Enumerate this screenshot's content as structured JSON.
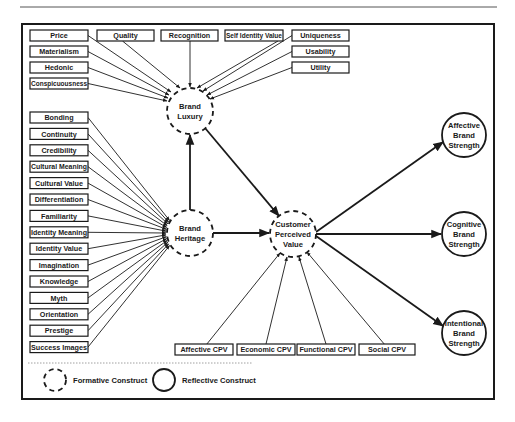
{
  "diagram": {
    "colors": {
      "stroke": "#1a1a1a",
      "background": "#ffffff",
      "rule": "#555555"
    },
    "constructs": [
      {
        "id": "brand_luxury",
        "lines": [
          "Brand",
          "Luxury"
        ],
        "type": "formative",
        "cx": 190,
        "cy": 111,
        "r": 23
      },
      {
        "id": "brand_heritage",
        "lines": [
          "Brand",
          "Heritage"
        ],
        "type": "formative",
        "cx": 190,
        "cy": 233,
        "r": 23
      },
      {
        "id": "customer_perceived_value",
        "lines": [
          "Customer",
          "Perceived",
          "Value"
        ],
        "type": "formative",
        "cx": 293,
        "cy": 234,
        "r": 23
      },
      {
        "id": "affective_brand_strength",
        "lines": [
          "Affective",
          "Brand",
          "Strength"
        ],
        "type": "reflective",
        "cx": 464,
        "cy": 135,
        "r": 22
      },
      {
        "id": "cognitive_brand_strength",
        "lines": [
          "Cognitive",
          "Brand",
          "Strength"
        ],
        "type": "reflective",
        "cx": 464,
        "cy": 234,
        "r": 22
      },
      {
        "id": "intentional_brand_strength",
        "lines": [
          "Intentional",
          "Brand",
          "Strength"
        ],
        "type": "reflective",
        "cx": 464,
        "cy": 333,
        "r": 22
      }
    ],
    "luxury_indicators": [
      {
        "label": "Price",
        "x": 30,
        "y": 30,
        "w": 58,
        "h": 11,
        "tx": 171,
        "ty": 92
      },
      {
        "label": "Materialism",
        "x": 30,
        "y": 46,
        "w": 58,
        "h": 11,
        "tx": 169,
        "ty": 95
      },
      {
        "label": "Hedonic",
        "x": 30,
        "y": 62,
        "w": 58,
        "h": 11,
        "tx": 168,
        "ty": 98
      },
      {
        "label": "Conspicuousness",
        "x": 30,
        "y": 78,
        "w": 58,
        "h": 11,
        "tx": 167,
        "ty": 101
      },
      {
        "label": "Quality",
        "x": 97,
        "y": 30,
        "w": 57,
        "h": 11,
        "tx": 180,
        "ty": 88
      },
      {
        "label": "Recognition",
        "x": 161,
        "y": 30,
        "w": 57,
        "h": 11,
        "tx": 190,
        "ty": 87
      },
      {
        "label": "Self Identity Value",
        "x": 225,
        "y": 30,
        "w": 58,
        "h": 11,
        "tx": 197,
        "ty": 88
      },
      {
        "label": "Uniqueness",
        "x": 292,
        "y": 30,
        "w": 57,
        "h": 11,
        "tx": 203,
        "ty": 91
      },
      {
        "label": "Usability",
        "x": 292,
        "y": 46,
        "w": 57,
        "h": 11,
        "tx": 207,
        "ty": 95
      },
      {
        "label": "Utility",
        "x": 292,
        "y": 62,
        "w": 57,
        "h": 11,
        "tx": 210,
        "ty": 99
      }
    ],
    "heritage_indicators": [
      {
        "label": "Bonding",
        "y": 112
      },
      {
        "label": "Continuity",
        "y": 128.4
      },
      {
        "label": "Credibility",
        "y": 144.8
      },
      {
        "label": "Cultural Meaning",
        "y": 161.2
      },
      {
        "label": "Cultural Value",
        "y": 177.6
      },
      {
        "label": "Differentiation",
        "y": 194
      },
      {
        "label": "Familiarity",
        "y": 210.4
      },
      {
        "label": "Identity Meaning",
        "y": 226.8
      },
      {
        "label": "Identity Value",
        "y": 243.2
      },
      {
        "label": "Imagination",
        "y": 259.6
      },
      {
        "label": "Knowledge",
        "y": 276
      },
      {
        "label": "Myth",
        "y": 292.4
      },
      {
        "label": "Orientation",
        "y": 308.8
      },
      {
        "label": "Prestige",
        "y": 325.2
      },
      {
        "label": "Success Images",
        "y": 341.6
      }
    ],
    "heritage_box": {
      "x": 30,
      "w": 58,
      "h": 11
    },
    "cpv_indicators": [
      {
        "label": "Affective CPV",
        "x": 175,
        "y": 344,
        "w": 58,
        "h": 11,
        "tx": 280,
        "ty": 253
      },
      {
        "label": "Economic CPV",
        "x": 237,
        "y": 344,
        "w": 58,
        "h": 11,
        "tx": 287,
        "ty": 257
      },
      {
        "label": "Functional CPV",
        "x": 297,
        "y": 344,
        "w": 58,
        "h": 11,
        "tx": 299,
        "ty": 257
      },
      {
        "label": "Social CPV",
        "x": 359,
        "y": 344,
        "w": 56,
        "h": 11,
        "tx": 307,
        "ty": 252
      }
    ],
    "structural_paths": [
      {
        "from": "brand_heritage",
        "x1": 190,
        "y1": 210,
        "x2": 190,
        "y2": 135
      },
      {
        "from": "brand_luxury",
        "x1": 205,
        "y1": 128,
        "x2": 279,
        "y2": 216
      },
      {
        "from": "brand_heritage",
        "x1": 213,
        "y1": 233,
        "x2": 269,
        "y2": 233
      },
      {
        "from": "customer_perceived_value",
        "x1": 316,
        "y1": 232,
        "x2": 443,
        "y2": 142
      },
      {
        "from": "customer_perceived_value",
        "x1": 316,
        "y1": 234,
        "x2": 441,
        "y2": 234
      },
      {
        "from": "customer_perceived_value",
        "x1": 316,
        "y1": 236,
        "x2": 443,
        "y2": 326
      }
    ],
    "legend": {
      "formative_label": "Formative Construct",
      "reflective_label": "Reflective Construct"
    }
  }
}
